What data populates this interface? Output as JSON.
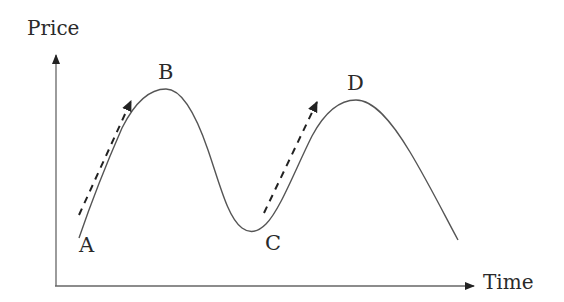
{
  "diagram": {
    "y_axis": {
      "label": "Price"
    },
    "x_axis": {
      "label": "Time"
    },
    "points": [
      {
        "id": "A",
        "label": "A"
      },
      {
        "id": "B",
        "label": "B"
      },
      {
        "id": "C",
        "label": "C"
      },
      {
        "id": "D",
        "label": "D"
      }
    ],
    "trend_arrows": [
      {
        "from": "A",
        "to": "B",
        "style": "dashed"
      },
      {
        "from": "C",
        "to": "D",
        "style": "dashed"
      }
    ],
    "colors": {
      "line": "#555555",
      "axis": "#666666",
      "text": "#2a2a2a",
      "background": "#ffffff"
    }
  }
}
